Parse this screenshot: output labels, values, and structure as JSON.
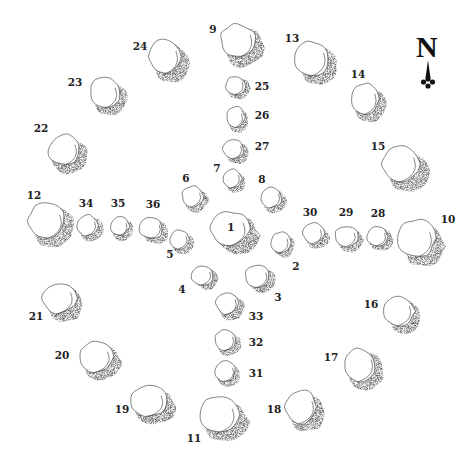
{
  "diagram": {
    "north_label": "N",
    "colors": {
      "ink": "#111111",
      "stone_fill": "#ffffff",
      "shadow": "#1a1a1a",
      "background": "#ffffff"
    },
    "stones": [
      {
        "id": "1",
        "label": "1",
        "size": "large",
        "group": "center"
      },
      {
        "id": "2",
        "label": "2",
        "size": "small",
        "group": "inner"
      },
      {
        "id": "3",
        "label": "3",
        "size": "medium",
        "group": "inner"
      },
      {
        "id": "4",
        "label": "4",
        "size": "small",
        "group": "inner"
      },
      {
        "id": "5",
        "label": "5",
        "size": "small",
        "group": "inner"
      },
      {
        "id": "6",
        "label": "6",
        "size": "small",
        "group": "inner"
      },
      {
        "id": "7",
        "label": "7",
        "size": "small",
        "group": "inner"
      },
      {
        "id": "8",
        "label": "8",
        "size": "small",
        "group": "inner"
      },
      {
        "id": "9",
        "label": "9",
        "size": "large",
        "group": "circle"
      },
      {
        "id": "10",
        "label": "10",
        "size": "large",
        "group": "circle"
      },
      {
        "id": "11",
        "label": "11",
        "size": "large",
        "group": "circle"
      },
      {
        "id": "12",
        "label": "12",
        "size": "large",
        "group": "circle"
      },
      {
        "id": "13",
        "label": "13",
        "size": "large",
        "group": "circle"
      },
      {
        "id": "14",
        "label": "14",
        "size": "medium",
        "group": "circle"
      },
      {
        "id": "15",
        "label": "15",
        "size": "large",
        "group": "circle"
      },
      {
        "id": "16",
        "label": "16",
        "size": "medium",
        "group": "circle"
      },
      {
        "id": "17",
        "label": "17",
        "size": "medium",
        "group": "circle"
      },
      {
        "id": "18",
        "label": "18",
        "size": "medium",
        "group": "circle"
      },
      {
        "id": "19",
        "label": "19",
        "size": "medium",
        "group": "circle"
      },
      {
        "id": "20",
        "label": "20",
        "size": "medium",
        "group": "circle"
      },
      {
        "id": "21",
        "label": "21",
        "size": "medium",
        "group": "circle"
      },
      {
        "id": "22",
        "label": "22",
        "size": "medium",
        "group": "circle"
      },
      {
        "id": "23",
        "label": "23",
        "size": "medium",
        "group": "circle"
      },
      {
        "id": "24",
        "label": "24",
        "size": "large",
        "group": "circle"
      },
      {
        "id": "25",
        "label": "25",
        "size": "small",
        "group": "north-row"
      },
      {
        "id": "26",
        "label": "26",
        "size": "small",
        "group": "north-row"
      },
      {
        "id": "27",
        "label": "27",
        "size": "small",
        "group": "north-row"
      },
      {
        "id": "28",
        "label": "28",
        "size": "small",
        "group": "east-row"
      },
      {
        "id": "29",
        "label": "29",
        "size": "small",
        "group": "east-row"
      },
      {
        "id": "30",
        "label": "30",
        "size": "small",
        "group": "east-row"
      },
      {
        "id": "31",
        "label": "31",
        "size": "small",
        "group": "south-row"
      },
      {
        "id": "32",
        "label": "32",
        "size": "small",
        "group": "south-row"
      },
      {
        "id": "33",
        "label": "33",
        "size": "small",
        "group": "south-row"
      },
      {
        "id": "34",
        "label": "34",
        "size": "small",
        "group": "west-row"
      },
      {
        "id": "35",
        "label": "35",
        "size": "small",
        "group": "west-row"
      },
      {
        "id": "36",
        "label": "36",
        "size": "small",
        "group": "west-row"
      }
    ]
  }
}
